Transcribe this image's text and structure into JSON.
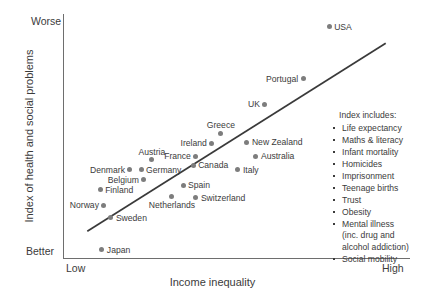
{
  "chart_data": {
    "type": "scatter",
    "title": "",
    "xlabel": "Income inequality",
    "ylabel": "Index of health and social problems",
    "x_tick_labels": [
      "Low",
      "High"
    ],
    "y_tick_labels": [
      "Better",
      "Worse"
    ],
    "xlim": [
      0,
      100
    ],
    "ylim": [
      0,
      100
    ],
    "grid": false,
    "legend_position": "right",
    "trendline": {
      "x0": 7.0,
      "y0": 11.0,
      "x1": 93.0,
      "y1": 88.0
    },
    "points": [
      {
        "label": "USA",
        "x": 76.7,
        "y": 94.7,
        "label_pos": "right"
      },
      {
        "label": "Portugal",
        "x": 69.2,
        "y": 73.4,
        "label_pos": "left"
      },
      {
        "label": "UK",
        "x": 58.2,
        "y": 63.1,
        "label_pos": "left"
      },
      {
        "label": "Greece",
        "x": 45.5,
        "y": 51.2,
        "label_pos": "top"
      },
      {
        "label": "New Zealand",
        "x": 53.0,
        "y": 47.5,
        "label_pos": "right"
      },
      {
        "label": "Ireland",
        "x": 42.9,
        "y": 47.1,
        "label_pos": "left"
      },
      {
        "label": "Australia",
        "x": 55.6,
        "y": 41.8,
        "label_pos": "right"
      },
      {
        "label": "Austria",
        "x": 25.6,
        "y": 40.2,
        "label_pos": "top"
      },
      {
        "label": "France",
        "x": 38.3,
        "y": 41.8,
        "label_pos": "left"
      },
      {
        "label": "Canada",
        "x": 37.5,
        "y": 38.1,
        "label_pos": "right"
      },
      {
        "label": "Italy",
        "x": 50.4,
        "y": 36.1,
        "label_pos": "right"
      },
      {
        "label": "Denmark",
        "x": 19.3,
        "y": 36.1,
        "label_pos": "left"
      },
      {
        "label": "Germany",
        "x": 22.5,
        "y": 36.1,
        "label_pos": "right"
      },
      {
        "label": "Belgium",
        "x": 23.3,
        "y": 32.0,
        "label_pos": "left"
      },
      {
        "label": "Spain",
        "x": 34.6,
        "y": 29.9,
        "label_pos": "right"
      },
      {
        "label": "Finland",
        "x": 10.7,
        "y": 27.9,
        "label_pos": "right"
      },
      {
        "label": "Switzerland",
        "x": 38.3,
        "y": 24.6,
        "label_pos": "right"
      },
      {
        "label": "Netherlands",
        "x": 31.4,
        "y": 25.4,
        "label_pos": "bottom"
      },
      {
        "label": "Norway",
        "x": 11.8,
        "y": 21.7,
        "label_pos": "left"
      },
      {
        "label": "Sweden",
        "x": 13.8,
        "y": 16.4,
        "label_pos": "right"
      },
      {
        "label": "Japan",
        "x": 11.2,
        "y": 3.3,
        "label_pos": "right"
      }
    ]
  },
  "legend": {
    "title": "Index includes:",
    "items": [
      {
        "text": "Life expectancy"
      },
      {
        "text": "Maths & literacy"
      },
      {
        "text": "Infant mortality"
      },
      {
        "text": "Homicides"
      },
      {
        "text": "Imprisonment"
      },
      {
        "text": "Teenage births"
      },
      {
        "text": "Trust"
      },
      {
        "text": "Obesity"
      },
      {
        "text": "Mental illness",
        "cont": [
          "(inc. drug and",
          "alcohol addiction)"
        ]
      },
      {
        "text": "Social mobility"
      }
    ]
  },
  "colors": {
    "point": "#7d7d7d",
    "axis": "#6e6e6e",
    "text": "#3b3b3b",
    "trendline": "#3a3a3a",
    "background": "#ffffff"
  }
}
